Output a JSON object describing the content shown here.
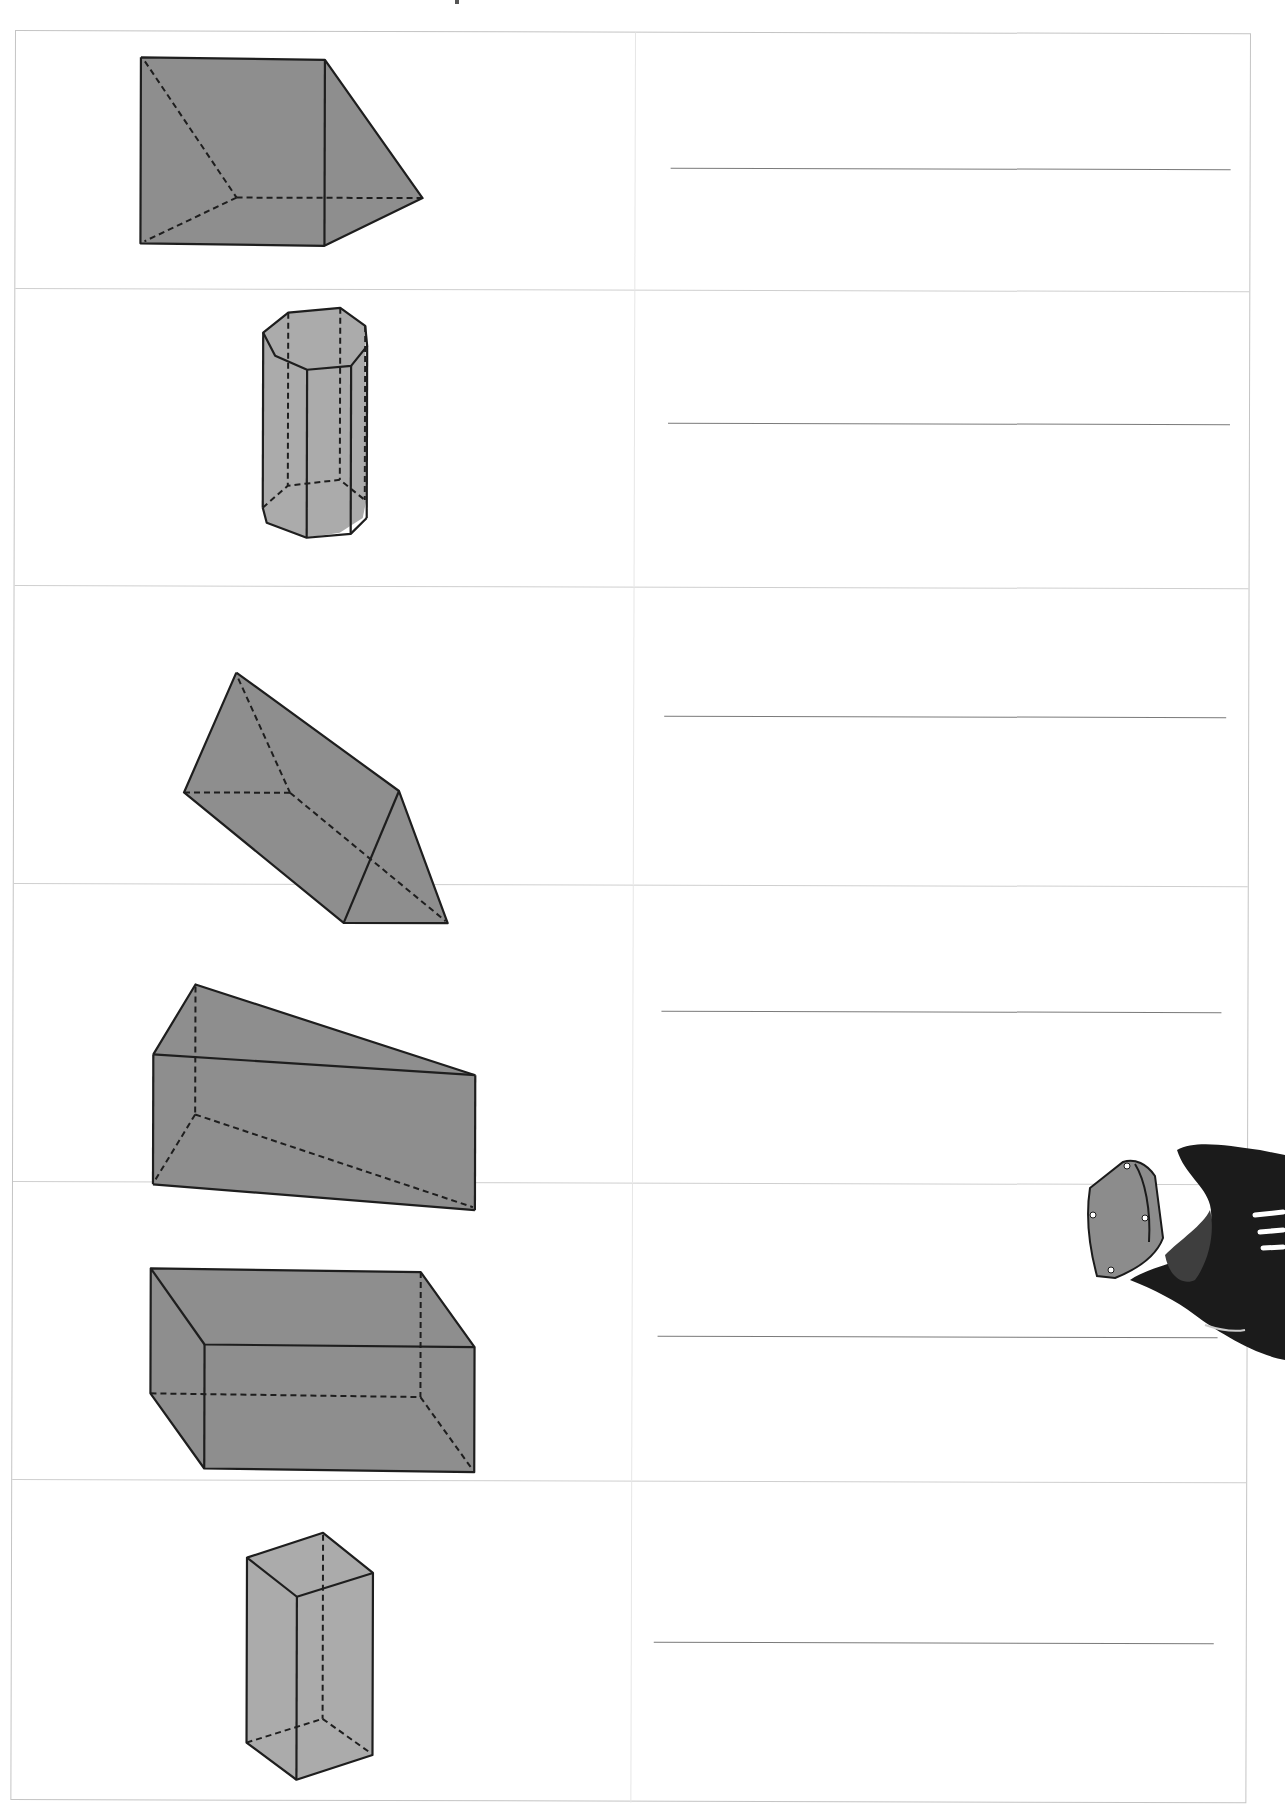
{
  "worksheet": {
    "title_fragment": "",
    "columns": [
      "shape",
      "answer"
    ],
    "rows": [
      {
        "shape": "right-triangular-prism-upright",
        "fill": "#8e8e8e",
        "answer": ""
      },
      {
        "shape": "hexagonal-prism",
        "fill": "#ababab",
        "answer": ""
      },
      {
        "shape": "triangular-prism-tilted",
        "fill": "#8e8e8e",
        "answer": ""
      },
      {
        "shape": "triangular-prism-lying",
        "fill": "#8e8e8e",
        "answer": ""
      },
      {
        "shape": "rectangular-prism",
        "fill": "#8e8e8e",
        "answer": ""
      },
      {
        "shape": "square-prism-tall",
        "fill": "#ababab",
        "answer": ""
      }
    ]
  },
  "colors": {
    "grid_border": "#c4c4c4",
    "answer_line": "#7a7a7a",
    "shape_edge": "#1e1e1e",
    "shape_fill_dark": "#8e8e8e",
    "shape_fill_light": "#ababab"
  },
  "decoration": {
    "mascot": "cartoon-headset-character-icon"
  }
}
